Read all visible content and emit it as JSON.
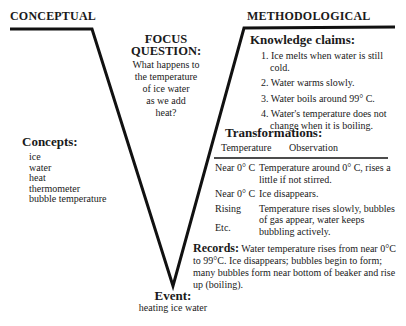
{
  "left_heading": "CONCEPTUAL",
  "right_heading": "METHODOLOGICAL",
  "focus": {
    "title_line1": "FOCUS",
    "title_line2": "QUESTION:",
    "lines": [
      "What happens to",
      "the temperature",
      "of ice water",
      "as we add",
      "heat?"
    ]
  },
  "concepts": {
    "title": "Concepts:",
    "items": [
      "ice",
      "water",
      "heat",
      "thermometer",
      "bubble temperature"
    ]
  },
  "knowledge_claims": {
    "title": "Knowledge claims:",
    "items": [
      "1. Ice melts when water is still cold.",
      "2. Water warms slowly.",
      "3. Water boils around 99° C.",
      "4. Water's temperature does not change when it is boiling."
    ]
  },
  "transformations": {
    "title": "Transformations:",
    "headers": [
      "Temperature",
      "Observation"
    ],
    "rows": [
      {
        "temp": "Near 0° C",
        "obs": "Temperature around 0° C, rises a little if not stirred."
      },
      {
        "temp": "Near 0° C",
        "obs": "Ice disappears."
      },
      {
        "temp": "Rising",
        "obs": "Temperature rises slowly, bubbles of gas appear, water keeps bubbling actively."
      }
    ],
    "etc": "Etc."
  },
  "records": {
    "label": "Records:",
    "text": "Water temperature rises from near 0°C to 99°C. Ice disappears; bubbles begin to form; many bubbles form near bottom of beaker and rise up (boiling)."
  },
  "event": {
    "title": "Event:",
    "text": "heating ice water"
  }
}
